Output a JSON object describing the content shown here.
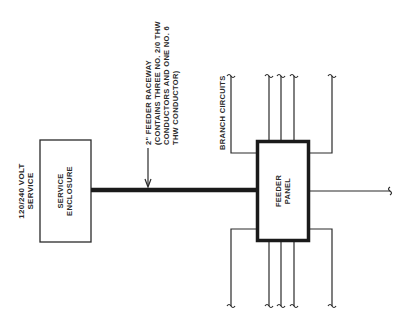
{
  "diagram": {
    "type": "electrical single-line feeder diagram",
    "colors": {
      "line": "#2a2a2a",
      "background": "#ffffff"
    },
    "service_label": {
      "line1": "120/240 VOLT",
      "line2": "SERVICE"
    },
    "service_enclosure": {
      "line1": "SERVICE",
      "line2": "ENCLOSURE"
    },
    "feeder_callout": {
      "line1": "2\" FEEDER RACEWAY",
      "line2": "(CONTAINS THREE NO. 2/0 THW",
      "line3": "CONDUCTORS AND ONE NO. 6",
      "line4": "THW CONDUCTOR)"
    },
    "branch_label": "BRANCH CIRCUITS",
    "feeder_panel": {
      "line1": "FEEDER",
      "line2": "PANEL"
    },
    "branch_circuits_top": 5,
    "branch_circuits_bottom": 5,
    "branch_circuits_right": 1
  }
}
